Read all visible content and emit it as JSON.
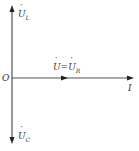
{
  "diagram": {
    "type": "phasor-diagram",
    "origin_label": "O",
    "axes": {
      "vertical_up": {
        "label_base": "U",
        "label_sub": "L",
        "full": "U̇L"
      },
      "vertical_down": {
        "label_base": "U",
        "label_sub": "C",
        "full": "U̇C"
      },
      "horizontal": {
        "label_base": "I",
        "full": "İ"
      }
    },
    "mid_phasor": {
      "label_left": "U",
      "eq": "=",
      "label_right": "U",
      "label_right_sub": "R",
      "full": "U̇=U̇R"
    },
    "colors": {
      "line": "#333333",
      "text": "#333333"
    }
  }
}
